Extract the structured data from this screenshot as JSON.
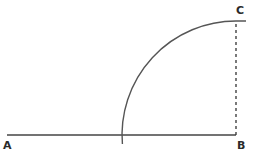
{
  "diagram": {
    "points": {
      "A": {
        "label": "A",
        "x": 7,
        "y": 135
      },
      "B": {
        "label": "B",
        "x": 236,
        "y": 135
      },
      "C": {
        "label": "C",
        "x": 236,
        "y": 21
      }
    },
    "segments": [
      {
        "name": "AB",
        "from": "A",
        "to": "B",
        "style": "solid"
      },
      {
        "name": "BC",
        "from": "B",
        "to": "C",
        "style": "dashed"
      }
    ],
    "arc": {
      "center": "B",
      "radius": 114,
      "description": "quarter-circle arc centered at B from line AB up to C"
    },
    "colors": {
      "stroke": "#444444",
      "label": "#2a2a2a",
      "background": "#ffffff"
    }
  }
}
